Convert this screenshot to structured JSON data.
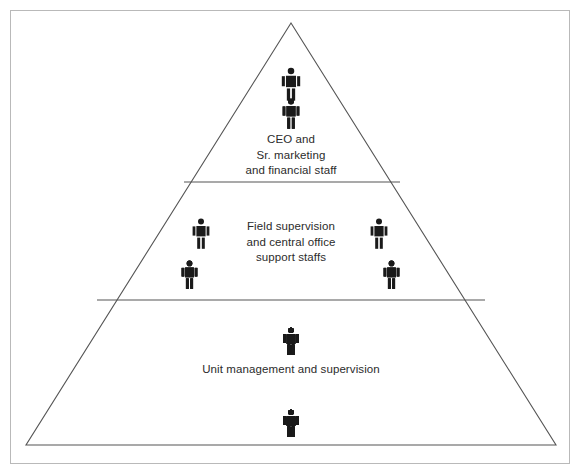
{
  "diagram": {
    "type": "organizational-pyramid",
    "figure_color": "#1a1a1a",
    "outline_color": "#555555",
    "frame_color": "#b9b9b9",
    "background_color": "#ffffff",
    "apex": {
      "x": 291,
      "y": 23
    },
    "base_left": {
      "x": 26,
      "y": 445
    },
    "base_right": {
      "x": 556,
      "y": 445
    },
    "dividers": [
      {
        "y": 182,
        "x_left": 184,
        "x_right": 400
      },
      {
        "y": 300,
        "x_left": 97,
        "x_right": 485
      }
    ],
    "tiers": [
      {
        "id": "tier-1",
        "level": 1,
        "label": "CEO and\nSr. marketing\nand financial staff",
        "label_lines": [
          "CEO and",
          "Sr. marketing",
          "and financial staff"
        ],
        "figure_count": 3,
        "groups": [
          {
            "id": "apex-top",
            "count": 1,
            "row": "top"
          },
          {
            "id": "apex-bottom",
            "count": 2,
            "row": "bottom"
          }
        ]
      },
      {
        "id": "tier-2",
        "level": 2,
        "label": "Field supervision\nand central office\nsupport staffs",
        "label_lines": [
          "Field supervision",
          "and central office",
          "support staffs"
        ],
        "figure_count": 8,
        "groups": [
          {
            "id": "left-top",
            "count": 1,
            "row": "top",
            "side": "left"
          },
          {
            "id": "left-bottom",
            "count": 3,
            "row": "bottom",
            "side": "left"
          },
          {
            "id": "right-top",
            "count": 1,
            "row": "top",
            "side": "right"
          },
          {
            "id": "right-bottom",
            "count": 3,
            "row": "bottom",
            "side": "right"
          }
        ]
      },
      {
        "id": "tier-3",
        "level": 3,
        "label": "Unit management and supervision",
        "label_lines": [
          "Unit management and supervision"
        ],
        "figure_count": 17,
        "groups": [
          {
            "id": "tier3-row",
            "count": 17,
            "row": "single"
          }
        ]
      },
      {
        "id": "tier-4",
        "level": 4,
        "label": "",
        "label_lines": [],
        "figure_count": 21,
        "groups": [
          {
            "id": "tier4-row",
            "count": 21,
            "row": "single"
          }
        ]
      }
    ],
    "icons": {
      "person": "person-pictogram"
    }
  }
}
